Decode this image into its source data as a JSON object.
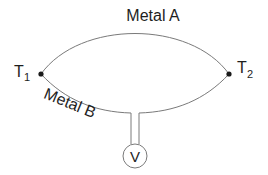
{
  "diagram": {
    "conductors": [
      {
        "id": "metal-a",
        "label": "Metal A",
        "path": "upper arc"
      },
      {
        "id": "metal-b",
        "label": "Metal B",
        "path": "lower arc"
      }
    ],
    "junctions": [
      {
        "id": "t1",
        "label_main": "T",
        "label_sub": "1"
      },
      {
        "id": "t2",
        "label_main": "T",
        "label_sub": "2"
      }
    ],
    "meter": {
      "symbol": "V",
      "type": "voltmeter"
    },
    "colors": {
      "wire": "#7a7a7a",
      "junction": "#1a1a1a",
      "text": "#1e1e1e",
      "background": "#ffffff"
    }
  }
}
